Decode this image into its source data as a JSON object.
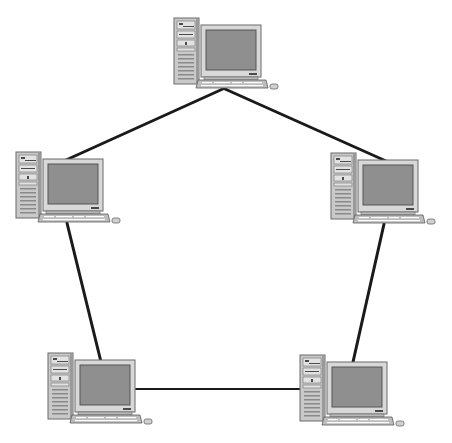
{
  "diagram": {
    "type": "ring-network-topology",
    "background": "#ffffff",
    "link_color": "#1a1a1a",
    "nodes": [
      {
        "id": "top",
        "icon": "desktop-computer-icon",
        "tower": [
          174,
          18
        ],
        "monitor": [
          201,
          25
        ],
        "keyboard": [
          196,
          78
        ]
      },
      {
        "id": "left",
        "icon": "desktop-computer-icon",
        "tower": [
          16,
          152
        ],
        "monitor": [
          43,
          160
        ],
        "keyboard": [
          40,
          212
        ]
      },
      {
        "id": "right",
        "icon": "desktop-computer-icon",
        "tower": [
          331,
          153
        ],
        "monitor": [
          358,
          161
        ],
        "keyboard": [
          354,
          214
        ]
      },
      {
        "id": "bottom-left",
        "icon": "desktop-computer-icon",
        "tower": [
          48,
          353
        ],
        "monitor": [
          76,
          360
        ],
        "keyboard": [
          72,
          412
        ]
      },
      {
        "id": "bottom-right",
        "icon": "desktop-computer-icon",
        "tower": [
          300,
          355
        ],
        "monitor": [
          328,
          362
        ],
        "keyboard": [
          324,
          414
        ]
      }
    ],
    "links": [
      {
        "from": "top",
        "to": "left",
        "x1": 225,
        "y1": 88,
        "x2": 66,
        "y2": 160
      },
      {
        "from": "top",
        "to": "right",
        "x1": 225,
        "y1": 89,
        "x2": 386,
        "y2": 161
      },
      {
        "from": "left",
        "to": "bottom-left",
        "x1": 67,
        "y1": 223,
        "x2": 101,
        "y2": 362
      },
      {
        "from": "right",
        "to": "bottom-right",
        "x1": 384,
        "y1": 224,
        "x2": 353,
        "y2": 362
      },
      {
        "from": "bottom-left",
        "to": "bottom-right",
        "x1": 136,
        "y1": 389,
        "x2": 302,
        "y2": 389
      }
    ]
  }
}
